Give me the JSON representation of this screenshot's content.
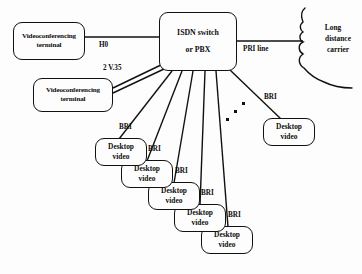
{
  "diagram": {
    "background_color": "#fdfdfd",
    "line_color": "#111111",
    "nodes": {
      "videoconferencing_terminal_1": {
        "line1": "Videoconferencing",
        "line2": "terminal"
      },
      "videoconferencing_terminal_2": {
        "line1": "Videoconferencing",
        "line2": "terminal"
      },
      "isdn_switch": {
        "line1": "ISDN switch",
        "line2": "or PBX"
      },
      "long_distance_carrier": {
        "line1": "Long",
        "line2": "distance",
        "line3": "carrier"
      },
      "desktop_video_right": {
        "line1": "Desktop",
        "line2": "video"
      },
      "desktop_video_cascade": [
        {
          "line1": "Desktop",
          "line2": "video"
        },
        {
          "line1": "Desktop",
          "line2": "video"
        },
        {
          "line1": "Desktop",
          "line2": "video"
        },
        {
          "line1": "Desktop",
          "line2": "video"
        },
        {
          "line1": "Desktop",
          "line2": "video"
        }
      ]
    },
    "link_labels": {
      "h0": "H0",
      "v35": "2 V.35",
      "pri": "PRI line",
      "bri_right": "BRI",
      "bri_cascade": [
        "BRI",
        "BRI",
        "BRI",
        "BRI",
        "BRI"
      ]
    },
    "ellipsis_dots": 3
  }
}
